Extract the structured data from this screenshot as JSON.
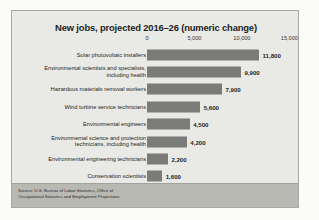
{
  "chart_data": {
    "type": "bar",
    "orientation": "horizontal",
    "title": "New jobs, projected 2016–26 (numeric change)",
    "xlabel": "",
    "ylabel": "",
    "xlim": [
      0,
      15800
    ],
    "grid": false,
    "legend": null,
    "tick_labels": [
      "0",
      "5,000",
      "10,000",
      "15,000"
    ],
    "tick_values": [
      0,
      5000,
      10000,
      15000
    ],
    "categories": [
      "Solar photovoltaic installers",
      "Environmental scientists and specialists,\nincluding health",
      "Hazardous materials removal workers",
      "Wind turbine service technicians",
      "Environmental engineers",
      "Environmental science and protection\ntechnicians, including health",
      "Environmental engineering technicians",
      "Conservation scientists"
    ],
    "values": [
      11800,
      9900,
      7900,
      5600,
      4500,
      4200,
      2200,
      1600
    ],
    "value_labels": [
      "11,800",
      "9,900",
      "7,900",
      "5,600",
      "4,500",
      "4,200",
      "2,200",
      "1,600"
    ],
    "bar_color": "#7b7b79",
    "panel_color": "#e9e9e6",
    "text_color": "#231f1e"
  },
  "source": {
    "text": "Source: U.S. Bureau of Labor Statistics, Office of\nOccupational Statistics and Employment Projections.",
    "band_color": "#b9b9b4"
  }
}
